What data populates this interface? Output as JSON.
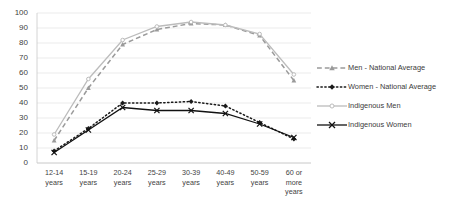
{
  "chart_data": {
    "type": "line",
    "title": "",
    "xlabel": "",
    "ylabel": "",
    "ylim": [
      0,
      100
    ],
    "ytick_step": 10,
    "grid": true,
    "legend_position": "right",
    "categories": [
      "12-14 years",
      "15-19 years",
      "20-24 years",
      "25-29 years",
      "30-39 years",
      "40-49 years",
      "50-59 years",
      "60 or more years"
    ],
    "category_lines": [
      [
        "12-14",
        "years"
      ],
      [
        "15-19",
        "years"
      ],
      [
        "20-24",
        "years"
      ],
      [
        "25-29",
        "years"
      ],
      [
        "30-39",
        "years"
      ],
      [
        "40-49",
        "years"
      ],
      [
        "50-59",
        "years"
      ],
      [
        "60 or",
        "more",
        "years"
      ]
    ],
    "ytick_labels": [
      "100",
      "90",
      "80",
      "70",
      "60",
      "50",
      "40",
      "30",
      "20",
      "10",
      "0"
    ],
    "series": [
      {
        "name": "Men - National Average",
        "values": [
          15,
          50,
          79,
          89,
          93,
          92,
          85,
          55
        ],
        "color": "#9a9a9a",
        "style": "dashed",
        "marker": "triangle"
      },
      {
        "name": "Women - National Average",
        "values": [
          8,
          23,
          40,
          40,
          41,
          38,
          27,
          16
        ],
        "color": "#1a1a1a",
        "style": "dotted",
        "marker": "diamond"
      },
      {
        "name": "Indigenous Men",
        "values": [
          19,
          56,
          82,
          91,
          94,
          92,
          86,
          59
        ],
        "color": "#bcbcbc",
        "style": "solid",
        "marker": "circle"
      },
      {
        "name": "Indigenous Women",
        "values": [
          7,
          22,
          37,
          35,
          35,
          33,
          26,
          17
        ],
        "color": "#111111",
        "style": "solid",
        "marker": "cross"
      }
    ]
  }
}
